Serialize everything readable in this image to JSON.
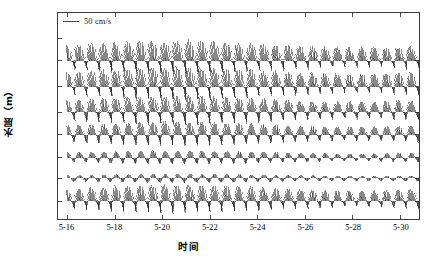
{
  "chart_data": {
    "type": "line",
    "subtype": "current-vector-stick-plot",
    "title": "",
    "xlabel": "时间",
    "ylabel": "水层（m）",
    "grid": false,
    "legend_position": "top-left",
    "legend": [
      {
        "name": "scale-reference",
        "label": "50 cm/s",
        "magnitude": 50,
        "units": "cm/s"
      }
    ],
    "x": {
      "label": "时间",
      "tick_labels": [
        "5-16",
        "5-18",
        "5-20",
        "5-22",
        "5-24",
        "5-26",
        "5-28",
        "5-30"
      ],
      "tick_values": [
        16,
        18,
        20,
        22,
        24,
        26,
        28,
        30
      ],
      "range": [
        15.6,
        30.8
      ],
      "minor_ticks": true
    },
    "y": {
      "label": "水层（m）",
      "tick_labels": [
        "4",
        "7",
        "10",
        "14",
        "18",
        "22",
        "垂向平均"
      ],
      "note": "Rows are depth layers in metres; last row is the depth-averaged current"
    },
    "series": [
      {
        "name": "layer-4m",
        "label": "4",
        "depth_m": 4,
        "baseline_frac": 0.232,
        "amp": 1.0,
        "dc_north": 0.2,
        "ellipticity": 0.3,
        "mean_angle_deg": 78,
        "tilt_deg": -12
      },
      {
        "name": "layer-7m",
        "label": "7",
        "depth_m": 7,
        "baseline_frac": 0.357,
        "amp": 0.96,
        "dc_north": 0.18,
        "ellipticity": 0.3,
        "mean_angle_deg": 77,
        "tilt_deg": -11
      },
      {
        "name": "layer-10m",
        "label": "10",
        "depth_m": 10,
        "baseline_frac": 0.482,
        "amp": 0.86,
        "dc_north": 0.14,
        "ellipticity": 0.28,
        "mean_angle_deg": 75,
        "tilt_deg": -10
      },
      {
        "name": "layer-14m",
        "label": "14",
        "depth_m": 14,
        "baseline_frac": 0.592,
        "amp": 0.7,
        "dc_north": 0.1,
        "ellipticity": 0.26,
        "mean_angle_deg": 72,
        "tilt_deg": -9
      },
      {
        "name": "layer-18m",
        "label": "18",
        "depth_m": 18,
        "baseline_frac": 0.702,
        "amp": 0.4,
        "dc_north": 0.04,
        "ellipticity": 0.22,
        "mean_angle_deg": 62,
        "tilt_deg": -7
      },
      {
        "name": "layer-22m",
        "label": "22",
        "depth_m": 22,
        "baseline_frac": 0.803,
        "amp": 0.26,
        "dc_north": 0.02,
        "ellipticity": 0.2,
        "mean_angle_deg": 55,
        "tilt_deg": -6
      },
      {
        "name": "depth-average",
        "label": "垂向平均",
        "depth_m": null,
        "baseline_frac": 0.913,
        "amp": 0.84,
        "dc_north": 0.15,
        "ellipticity": 0.28,
        "mean_angle_deg": 74,
        "tilt_deg": -10
      }
    ],
    "tide": {
      "description": "Semi-diurnal tidal current with spring-neap modulation",
      "period_days": 0.5175,
      "spring_neap_period_days": 14.8,
      "spring_neap_depth": 0.42,
      "samples_per_day": 34,
      "record_start": "5-16",
      "record_end": "5-30"
    },
    "style": {
      "stick_color": "#262626",
      "frame_color": "#3a3a3a",
      "background": "#ffffff",
      "stick_width_px": 0.55
    }
  },
  "axes": {
    "y_tick_labels": [
      "4",
      "7",
      "10",
      "14",
      "18",
      "22",
      "垂向平均"
    ],
    "y_title": "水层（m）",
    "x_tick_labels": [
      "5-16",
      "5-18",
      "5-20",
      "5-22",
      "5-24",
      "5-26",
      "5-28",
      "5-30"
    ],
    "x_title": "时间"
  },
  "legend": {
    "scale_label": "50 cm/s"
  }
}
